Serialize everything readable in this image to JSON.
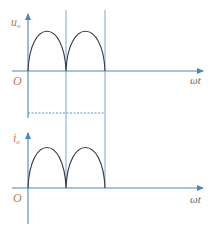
{
  "diagram": {
    "title": "",
    "colors": {
      "axis": "#4a86c5",
      "guide": "#7aa7d6",
      "waveform": "#3c3c4a",
      "label": "#c07850",
      "axis_label": "#6a6a6a"
    },
    "upper_plot": {
      "y_label": "u",
      "y_label_sub": "o",
      "origin_label": "O",
      "x_label": "ωt",
      "waveform": "full-wave rectified sine (two half-cycles)"
    },
    "lower_plot": {
      "y_label": "i",
      "y_label_sub": "o",
      "origin_label": "O",
      "x_label": "ωt",
      "waveform": "full-wave rectified sine (two half-cycles)"
    },
    "guides": {
      "vertical_lines": 2,
      "dashed_horizontal_line": true
    }
  }
}
